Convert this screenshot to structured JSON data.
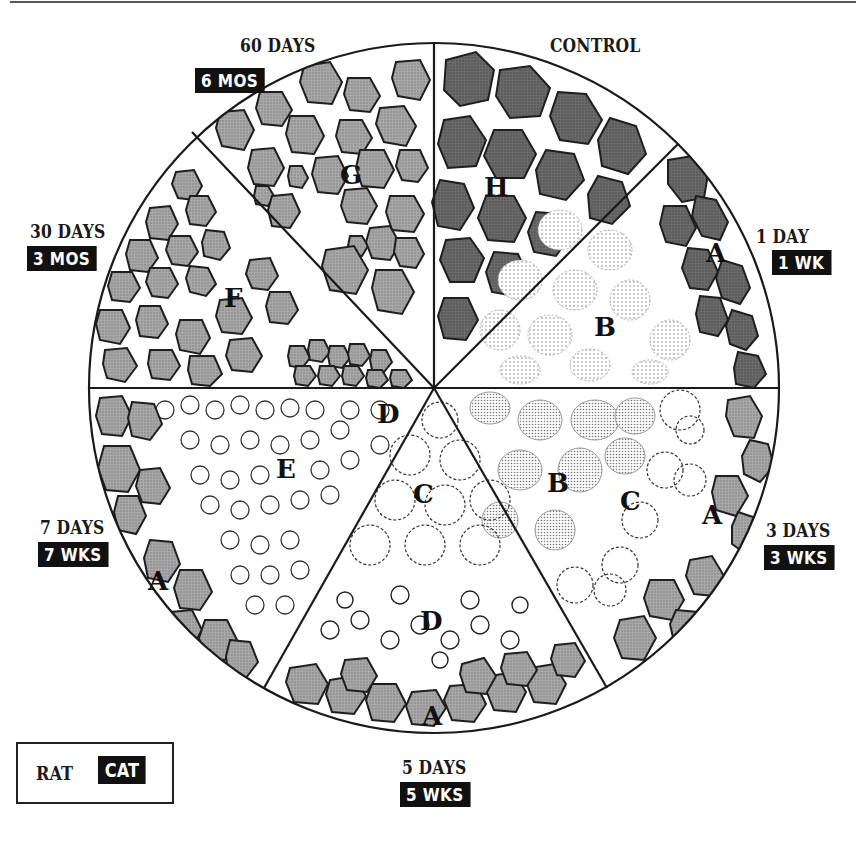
{
  "figure": {
    "type": "sectored-circle-diagram",
    "center": [
      434,
      388
    ],
    "radius": 345,
    "colors": {
      "fiber_control": "#6e6e6e",
      "fiber_regenerated": "#9a9a9a",
      "fiber_outline": "#1e1e1e",
      "label_bg": "#111111",
      "label_fg": "#ffffff",
      "ink": "#1a1a1a"
    }
  },
  "legend": {
    "rat_label": "RAT",
    "cat_label": "CAT"
  },
  "sectors": [
    {
      "id": "control",
      "rat_time": "CONTROL",
      "cat_time": "",
      "letters": [
        "H"
      ]
    },
    {
      "id": "1day",
      "rat_time": "1 DAY",
      "cat_time": "1 WK",
      "letters": [
        "A",
        "B"
      ]
    },
    {
      "id": "3days",
      "rat_time": "3 DAYS",
      "cat_time": "3 WKS",
      "letters": [
        "A",
        "B",
        "C"
      ]
    },
    {
      "id": "5days",
      "rat_time": "5 DAYS",
      "cat_time": "5 WKS",
      "letters": [
        "A",
        "C",
        "D"
      ]
    },
    {
      "id": "7days",
      "rat_time": "7 DAYS",
      "cat_time": "7 WKS",
      "letters": [
        "A",
        "D",
        "E"
      ]
    },
    {
      "id": "30days",
      "rat_time": "30 DAYS",
      "cat_time": "3 MOS",
      "letters": [
        "F"
      ]
    },
    {
      "id": "60days",
      "rat_time": "60 DAYS",
      "cat_time": "6 MOS",
      "letters": [
        "G"
      ]
    }
  ],
  "labels": {
    "control": "CONTROL",
    "d1": "1 DAY",
    "w1": "1 WK",
    "d3": "3 DAYS",
    "w3": "3 WKS",
    "d5": "5 DAYS",
    "w5": "5 WKS",
    "d7": "7 DAYS",
    "w7": "7 WKS",
    "d30": "30 DAYS",
    "m3": "3 MOS",
    "d60": "60 DAYS",
    "m6": "6 MOS"
  },
  "sector_letters": {
    "H": "H",
    "A1": "A",
    "B1": "B",
    "B2": "B",
    "C1": "C",
    "A2": "A",
    "C2": "C",
    "D1": "D",
    "D2": "D",
    "A3": "A",
    "E": "E",
    "A4": "A",
    "F": "F",
    "G": "G"
  }
}
